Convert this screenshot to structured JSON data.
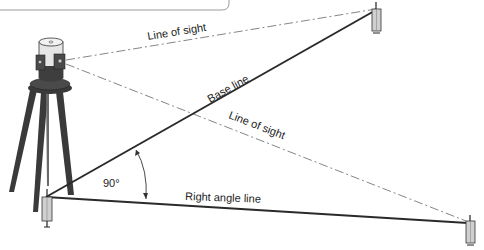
{
  "diagram": {
    "title": "",
    "labels": {
      "line_of_sight_upper": "Line of sight",
      "base_line": "Base line",
      "line_of_sight_lower": "Line of sight",
      "angle": "90°",
      "right_angle_line": "Right angle line"
    },
    "elements": {
      "instrument": "builders-level-on-tripod",
      "stakes": [
        "near-stake",
        "far-stake-base-line",
        "far-stake-right-angle-line"
      ]
    },
    "colors": {
      "line": "#2a2a2a",
      "dashed_line": "#777777",
      "instrument_dark": "#3a3a3a",
      "instrument_light": "#e6e6e6",
      "stake_fill": "#cfcfcf",
      "frame": "#9a9a9a"
    }
  }
}
